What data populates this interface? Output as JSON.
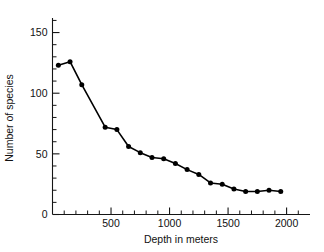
{
  "chart_data": {
    "type": "line",
    "title": "",
    "subtitle": "",
    "xlabel": "Depth in meters",
    "ylabel": "Number of species",
    "xlim": [
      0,
      2200
    ],
    "ylim": [
      0,
      162
    ],
    "grid": false,
    "legend": null,
    "x_ticks_major": [
      500,
      1000,
      1500,
      2000
    ],
    "x_tick_labels": [
      "500",
      "1000",
      "1500",
      "2000"
    ],
    "x_ticks_minor": [
      100,
      200,
      300,
      400,
      600,
      700,
      800,
      900,
      1100,
      1200,
      1300,
      1400,
      1600,
      1700,
      1800,
      1900,
      2100
    ],
    "y_ticks_major": [
      0,
      50,
      100,
      150
    ],
    "y_tick_labels": [
      "0",
      "50",
      "100",
      "150"
    ],
    "y_ticks_minor": [
      10,
      20,
      30,
      40,
      60,
      70,
      80,
      90,
      110,
      120,
      130,
      140,
      160
    ],
    "marker": "filled-circle",
    "line_color": "#000000",
    "marker_color": "#000000",
    "x": [
      50,
      150,
      250,
      450,
      550,
      650,
      750,
      850,
      950,
      1050,
      1150,
      1250,
      1350,
      1450,
      1550,
      1650,
      1750,
      1850,
      1950
    ],
    "values": [
      123,
      126,
      107,
      72,
      70,
      56,
      51,
      47,
      46,
      42,
      37,
      33,
      26,
      25,
      21,
      19,
      19,
      20,
      19
    ],
    "series": [
      {
        "name": "Number of species",
        "x": [
          50,
          150,
          250,
          450,
          550,
          650,
          750,
          850,
          950,
          1050,
          1150,
          1250,
          1350,
          1450,
          1550,
          1650,
          1750,
          1850,
          1950
        ],
        "values": [
          123,
          126,
          107,
          72,
          70,
          56,
          51,
          47,
          46,
          42,
          37,
          33,
          26,
          25,
          21,
          19,
          19,
          20,
          19
        ]
      }
    ]
  }
}
